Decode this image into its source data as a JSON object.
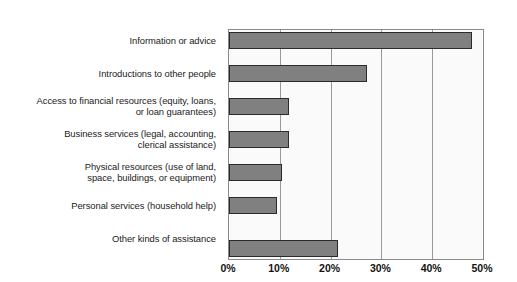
{
  "chart_data": {
    "type": "bar",
    "orientation": "horizontal",
    "title": "",
    "subtitle": "",
    "xlabel": "",
    "ylabel": "",
    "xlim": [
      0,
      50
    ],
    "grid": true,
    "legend": null,
    "xtick_labels": [
      "0%",
      "10%",
      "20%",
      "30%",
      "40%",
      "50%"
    ],
    "xtick_values": [
      0,
      10,
      20,
      30,
      40,
      50
    ],
    "categories": [
      "Information or advice",
      "Introductions to other people",
      "Access to financial resources (equity, loans,\nor loan guarantees)",
      "Business services (legal, accounting,\nclerical assistance)",
      "Physical resources (use of land,\nspace, buildings, or equipment)",
      "Personal services (household help)",
      "Other kinds of assistance"
    ],
    "values": [
      47.8,
      27.2,
      11.8,
      11.8,
      10.4,
      9.4,
      21.5
    ],
    "value_labels": [
      "",
      "",
      "",
      "",
      "",
      "",
      ""
    ],
    "colors": {
      "bar_fill": "#808080",
      "bar_border": "#2b2b2b",
      "plot_background": "#fafafa",
      "plot_border": "#8a8a8a",
      "gridline": "#9a9a9a",
      "text": "#1a1a1a",
      "page_background": "#ffffff"
    }
  }
}
